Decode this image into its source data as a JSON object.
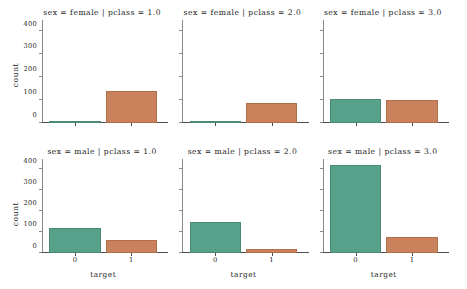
{
  "chart_data": {
    "type": "bar",
    "title": "",
    "xlabel": "target",
    "ylabel": "count",
    "categories": [
      "0",
      "1"
    ],
    "ylim": [
      0,
      440
    ],
    "yticks": [
      0,
      100,
      200,
      300,
      400
    ],
    "ytick_labels": [
      "0",
      "100",
      "200",
      "300",
      "400"
    ],
    "grid": false,
    "legend": "none",
    "facet_rows": [
      "female",
      "male"
    ],
    "facet_cols": [
      "1.0",
      "2.0",
      "3.0"
    ],
    "bar_colors": {
      "cat0": "#57a18a",
      "cat1": "#c9825b"
    },
    "panels": [
      {
        "title": "sex = female  |  pclass = 1.0",
        "sex": "female",
        "pclass": "1.0",
        "categories": [
          "0",
          "1"
        ],
        "values": [
          3,
          136
        ]
      },
      {
        "title": "sex = female  |  pclass = 2.0",
        "sex": "female",
        "pclass": "2.0",
        "categories": [
          "0",
          "1"
        ],
        "values": [
          6,
          87
        ]
      },
      {
        "title": "sex = female  |  pclass = 3.0",
        "sex": "female",
        "pclass": "3.0",
        "categories": [
          "0",
          "1"
        ],
        "values": [
          103,
          99
        ]
      },
      {
        "title": "sex = male  |  pclass = 1.0",
        "sex": "male",
        "pclass": "1.0",
        "categories": [
          "0",
          "1"
        ],
        "values": [
          118,
          61
        ]
      },
      {
        "title": "sex = male  |  pclass = 2.0",
        "sex": "male",
        "pclass": "2.0",
        "categories": [
          "0",
          "1"
        ],
        "values": [
          146,
          21
        ]
      },
      {
        "title": "sex = male  |  pclass = 3.0",
        "sex": "male",
        "pclass": "3.0",
        "categories": [
          "0",
          "1"
        ],
        "values": [
          417,
          75
        ]
      }
    ]
  }
}
